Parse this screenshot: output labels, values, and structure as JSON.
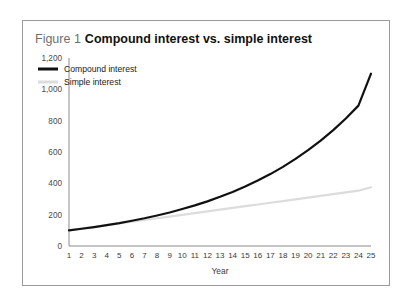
{
  "figure": {
    "number_label": "Figure 1",
    "title": "Compound interest vs. simple interest"
  },
  "chart_data": {
    "type": "line",
    "title": "Compound interest vs. simple interest",
    "xlabel": "Year",
    "ylabel": "",
    "xlim": [
      1,
      25
    ],
    "ylim": [
      0,
      1200
    ],
    "grid": false,
    "legend_position": "top-left",
    "y_ticks": [
      0,
      200,
      400,
      600,
      800,
      1000,
      1200
    ],
    "y_tick_labels": [
      "0",
      "200",
      "400",
      "600",
      "800",
      "1,000",
      "1,200"
    ],
    "x": [
      1,
      2,
      3,
      4,
      5,
      6,
      7,
      8,
      9,
      10,
      11,
      12,
      13,
      14,
      15,
      16,
      17,
      18,
      19,
      20,
      21,
      22,
      23,
      24,
      25
    ],
    "x_tick_labels": [
      "1",
      "2",
      "3",
      "4",
      "5",
      "6",
      "7",
      "8",
      "9",
      "10",
      "11",
      "12",
      "13",
      "14",
      "15",
      "16",
      "17",
      "18",
      "19",
      "20",
      "21",
      "22",
      "23",
      "24",
      "25"
    ],
    "series": [
      {
        "name": "Compound interest",
        "color": "#111111",
        "values": [
          100,
          110,
          121,
          133,
          146,
          161,
          177,
          195,
          214,
          236,
          259,
          285,
          314,
          345,
          380,
          418,
          459,
          505,
          556,
          612,
          673,
          740,
          814,
          896,
          1100
        ]
      },
      {
        "name": "Simple interest",
        "color": "#dcdcdc",
        "values": [
          100,
          111,
          122,
          133,
          144,
          155,
          166,
          177,
          188,
          199,
          210,
          221,
          232,
          243,
          254,
          265,
          276,
          287,
          298,
          309,
          320,
          331,
          342,
          353,
          375
        ]
      }
    ]
  },
  "legend": {
    "items": [
      {
        "label": "Compound interest",
        "color": "#111111"
      },
      {
        "label": "Simple interest",
        "color": "#dcdcdc"
      }
    ]
  },
  "colors": {
    "frame_border": "#9a9a9a",
    "axis_line": "#8c8c8c",
    "background": "#ffffff"
  }
}
